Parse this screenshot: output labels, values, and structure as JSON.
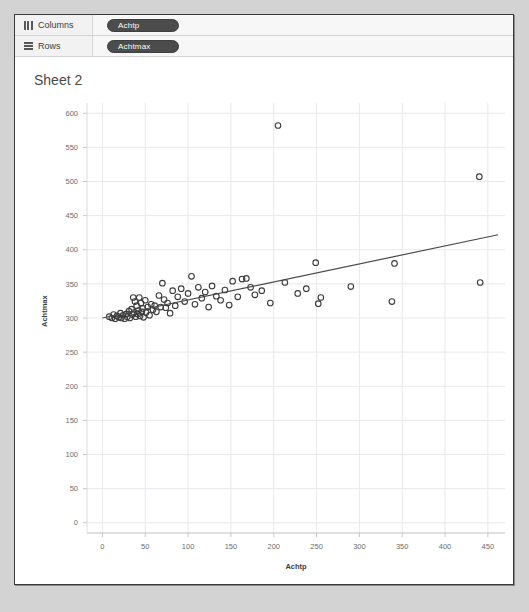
{
  "window": {
    "shelves": [
      {
        "name": "columns",
        "label": "Columns",
        "icon": "columns-icon",
        "pill": "Achtp"
      },
      {
        "name": "rows",
        "label": "Rows",
        "icon": "rows-icon",
        "pill": "Achtmax"
      }
    ],
    "sheet_title": "Sheet 2"
  },
  "colors": {
    "pill_background": "#4c4c4c",
    "pill_text": "#ffffff",
    "marker_stroke": "#3b3b3b",
    "trend_line": "#4a4a4a",
    "grid": "#e8e8ee",
    "axis_text": "#6d6d6d",
    "panel_background": "#ffffff",
    "app_background": "#d3d3d3"
  },
  "chart_data": {
    "type": "scatter",
    "title": "",
    "xlabel": "Achtp",
    "ylabel": "Achtmax",
    "xlim": [
      -18,
      470
    ],
    "ylim": [
      -15,
      615
    ],
    "xticks": [
      0,
      50,
      100,
      150,
      200,
      250,
      300,
      350,
      400,
      450
    ],
    "yticks": [
      0,
      50,
      100,
      150,
      200,
      250,
      300,
      350,
      400,
      450,
      500,
      550,
      600
    ],
    "grid": true,
    "legend": null,
    "marker": {
      "shape": "circle",
      "filled": false,
      "size": 4
    },
    "points": [
      [
        8,
        302
      ],
      [
        11,
        300
      ],
      [
        13,
        305
      ],
      [
        15,
        299
      ],
      [
        17,
        303
      ],
      [
        19,
        301
      ],
      [
        21,
        307
      ],
      [
        22,
        300
      ],
      [
        24,
        304
      ],
      [
        26,
        299
      ],
      [
        28,
        306
      ],
      [
        29,
        302
      ],
      [
        31,
        310
      ],
      [
        32,
        300
      ],
      [
        34,
        313
      ],
      [
        35,
        305
      ],
      [
        36,
        330
      ],
      [
        37,
        308
      ],
      [
        38,
        324
      ],
      [
        39,
        302
      ],
      [
        40,
        318
      ],
      [
        41,
        306
      ],
      [
        42,
        311
      ],
      [
        43,
        330
      ],
      [
        44,
        303
      ],
      [
        45,
        322
      ],
      [
        46,
        309
      ],
      [
        47,
        314
      ],
      [
        48,
        301
      ],
      [
        50,
        326
      ],
      [
        51,
        308
      ],
      [
        53,
        316
      ],
      [
        55,
        304
      ],
      [
        57,
        320
      ],
      [
        59,
        312
      ],
      [
        61,
        318
      ],
      [
        63,
        309
      ],
      [
        66,
        333
      ],
      [
        68,
        316
      ],
      [
        70,
        351
      ],
      [
        72,
        327
      ],
      [
        74,
        315
      ],
      [
        76,
        322
      ],
      [
        79,
        307
      ],
      [
        82,
        340
      ],
      [
        85,
        318
      ],
      [
        88,
        331
      ],
      [
        92,
        343
      ],
      [
        96,
        324
      ],
      [
        100,
        336
      ],
      [
        104,
        361
      ],
      [
        108,
        320
      ],
      [
        112,
        345
      ],
      [
        116,
        329
      ],
      [
        120,
        338
      ],
      [
        124,
        316
      ],
      [
        128,
        347
      ],
      [
        133,
        332
      ],
      [
        138,
        326
      ],
      [
        143,
        341
      ],
      [
        148,
        319
      ],
      [
        152,
        354
      ],
      [
        158,
        331
      ],
      [
        163,
        357
      ],
      [
        168,
        358
      ],
      [
        173,
        345
      ],
      [
        178,
        334
      ],
      [
        186,
        340
      ],
      [
        196,
        322
      ],
      [
        205,
        582
      ],
      [
        213,
        352
      ],
      [
        228,
        336
      ],
      [
        238,
        343
      ],
      [
        249,
        381
      ],
      [
        252,
        321
      ],
      [
        255,
        330
      ],
      [
        290,
        346
      ],
      [
        338,
        324
      ],
      [
        341,
        380
      ],
      [
        440,
        507
      ],
      [
        441,
        352
      ]
    ],
    "trend_line": {
      "type": "linear",
      "x_start": 0,
      "y_start": 300,
      "x_end": 462,
      "y_end": 422
    },
    "annotations": [
      {
        "text": "outlier",
        "x": 205,
        "y": 582
      },
      {
        "text": "outlier",
        "x": 440,
        "y": 507
      }
    ]
  }
}
